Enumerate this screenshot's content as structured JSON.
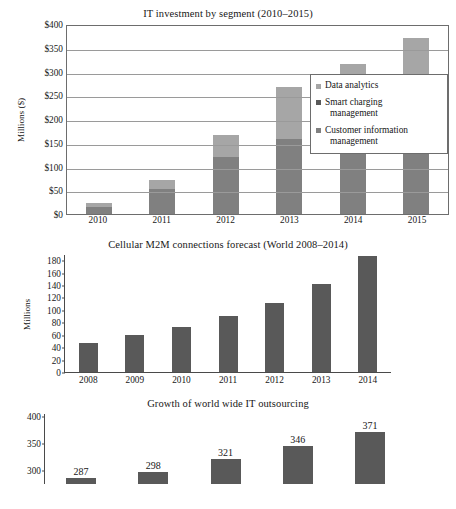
{
  "page": {
    "background_color": "#ffffff"
  },
  "colors": {
    "data_analytics": "#a6a6a6",
    "smart_charging_management": "#595959",
    "customer_information_management": "#808080",
    "bar_dark": "#595959",
    "axis": "#4a4a4a",
    "grid": "#9a9a9a",
    "text": "#171717"
  },
  "chart_data": [
    {
      "id": "it-investment-by-segment",
      "type": "bar",
      "stacked": true,
      "title": "IT investment by segment (2010–2015)",
      "xlabel": "",
      "ylabel": "Millions ($)",
      "categories": [
        "2010",
        "2011",
        "2012",
        "2013",
        "2014",
        "2015"
      ],
      "ylim": [
        0,
        400
      ],
      "yticks": [
        0,
        50,
        100,
        150,
        200,
        250,
        300,
        350,
        400
      ],
      "ytick_labels": [
        "$0",
        "$50",
        "$100",
        "$150",
        "$200",
        "$250",
        "$300",
        "$350",
        "$400"
      ],
      "grid": true,
      "legend_position": "right",
      "series": [
        {
          "name": "Customer information management",
          "color": "#808080",
          "values": [
            14,
            52,
            119,
            158,
            162,
            172
          ]
        },
        {
          "name": "Smart charging management",
          "color": "#595959",
          "values": [
            0,
            0,
            0,
            0,
            0,
            0
          ]
        },
        {
          "name": "Data analytics",
          "color": "#a6a6a6",
          "values": [
            9,
            19,
            48,
            109,
            153,
            199
          ]
        }
      ],
      "legend_entries": [
        {
          "label": "Data analytics",
          "label_line2": "",
          "color": "#a6a6a6"
        },
        {
          "label": "Smart charging",
          "label_line2": "management",
          "color": "#595959"
        },
        {
          "label": "Customer information",
          "label_line2": "management",
          "color": "#808080"
        }
      ]
    },
    {
      "id": "cellular-m2m-connections-forecast",
      "type": "bar",
      "stacked": false,
      "title": "Cellular M2M connections forecast (World 2008–2014)",
      "xlabel": "",
      "ylabel": "Millions",
      "categories": [
        "2008",
        "2009",
        "2010",
        "2011",
        "2012",
        "2013",
        "2014"
      ],
      "ylim": [
        0,
        190
      ],
      "yticks": [
        0,
        20,
        40,
        60,
        80,
        100,
        120,
        140,
        160,
        180
      ],
      "ytick_labels": [
        "0",
        "20",
        "40",
        "60",
        "80",
        "100",
        "120",
        "140",
        "160",
        "180"
      ],
      "grid": false,
      "series": [
        {
          "name": "Cellular M2M connections",
          "color": "#595959",
          "values": [
            47,
            60,
            73,
            90,
            111,
            141,
            187
          ]
        }
      ]
    },
    {
      "id": "growth-of-worldwide-it-outsourcing",
      "type": "bar",
      "stacked": false,
      "title": "Growth of world wide IT outsourcing",
      "xlabel": "",
      "ylabel": "",
      "clipped": true,
      "categories": [
        "",
        "",
        "",
        "",
        ""
      ],
      "ylim": [
        0,
        400
      ],
      "yticks": [
        300,
        350,
        400
      ],
      "ytick_labels": [
        "300",
        "350",
        "400"
      ],
      "grid": false,
      "data_labels": [
        "287",
        "298",
        "321",
        "346",
        "371"
      ],
      "series": [
        {
          "name": "Worldwide IT outsourcing",
          "color": "#595959",
          "values": [
            287,
            298,
            321,
            346,
            371
          ]
        }
      ]
    }
  ]
}
